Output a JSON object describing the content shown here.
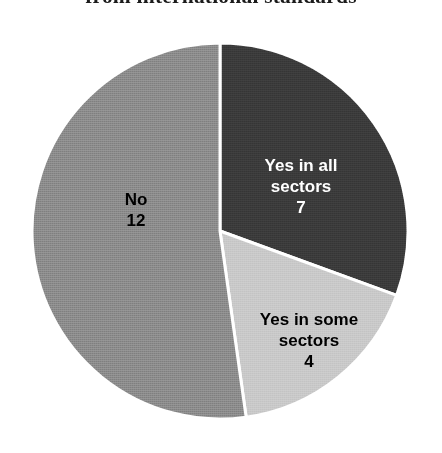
{
  "title": {
    "text": "from international standards"
  },
  "chart_data": {
    "type": "pie",
    "title": "from international standards",
    "xlabel": "",
    "ylabel": "",
    "total": 23,
    "legend": "none (labels drawn inside slices)",
    "grid": false,
    "start_angle_deg": 0,
    "direction": "clockwise",
    "categories": [
      "Yes in all sectors",
      "Yes in some sectors",
      "No"
    ],
    "values": [
      7,
      4,
      12
    ],
    "colors": [
      "#3a3a3a",
      "#c8c8c8",
      "#8a8a8a"
    ],
    "slices": [
      {
        "label": "Yes in all sectors",
        "label_line1": "Yes in all",
        "label_line2": "sectors",
        "value": 7,
        "color": "#3a3a3a",
        "start_deg": 0,
        "end_deg": 110,
        "text_color": "#ffffff"
      },
      {
        "label": "Yes in some sectors",
        "label_line1": "Yes in some",
        "label_line2": "sectors",
        "value": 4,
        "color": "#c8c8c8",
        "start_deg": 110,
        "end_deg": 172,
        "text_color": "#000000"
      },
      {
        "label": "No",
        "label_line1": "No",
        "label_line2": "",
        "value": 12,
        "color": "#8a8a8a",
        "start_deg": 172,
        "end_deg": 360,
        "text_color": "#000000"
      }
    ],
    "separator_color": "#ffffff",
    "background": "#ffffff"
  }
}
